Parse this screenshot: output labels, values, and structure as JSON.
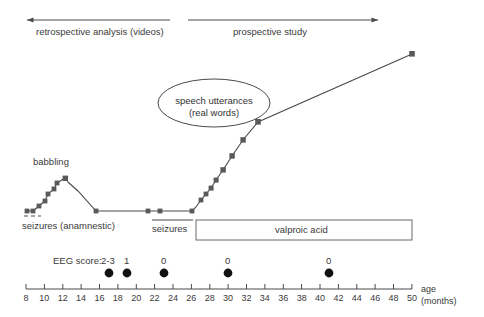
{
  "figure": {
    "title_phases": {
      "retrospective": "retrospective analysis (videos)",
      "prospective": "prospective study"
    },
    "annotations": {
      "babbling": "babbling",
      "speech_line1": "speech utterances",
      "speech_line2": "(real words)",
      "seizures_anamnestic": "seizures (anamnestic)",
      "seizures": "seizures",
      "valproic_acid": "valproic acid",
      "eeg_score_label": "EEG score:"
    },
    "axis": {
      "label_line1": "age",
      "label_line2": "(months)",
      "ticks": [
        "8",
        "10",
        "12",
        "14",
        "16",
        "18",
        "20",
        "22",
        "24",
        "26",
        "28",
        "30",
        "32",
        "34",
        "36",
        "38",
        "40",
        "42",
        "44",
        "46",
        "48",
        "50"
      ],
      "min": 8,
      "max": 50,
      "step": 2
    },
    "eeg_scores": [
      {
        "label": "2-3",
        "age": 26
      },
      {
        "label": "1",
        "age": 28
      },
      {
        "label": "0",
        "age": 32
      },
      {
        "label": "0",
        "age": 39
      },
      {
        "label": "0",
        "age": 50
      }
    ],
    "colors": {
      "line": "#4a4a4a",
      "marker": "#595959",
      "text": "#3a3a3a",
      "eeg_dot": "#111111",
      "box_border": "#6b6b6b"
    }
  },
  "chart_data": {
    "type": "line",
    "title": "",
    "xlabel": "age (months)",
    "ylabel": "language development (speech utterances / real words)",
    "xlim": [
      8,
      50
    ],
    "grid": false,
    "legend": "none",
    "series": [
      {
        "name": "language development",
        "x": [
          8.3,
          9.6,
          11.0,
          11.9,
          12.6,
          14.2,
          16.5,
          22.0,
          23.2,
          26.0,
          26.9,
          27.6,
          28.4,
          29.2,
          30.2,
          31.6,
          33.6,
          35.9,
          39.0,
          50.0
        ],
        "y": [
          2,
          2,
          5,
          8,
          12,
          2,
          2,
          2,
          2,
          2,
          9,
          14,
          20,
          25,
          33,
          44,
          57,
          70,
          84,
          124
        ]
      }
    ],
    "annotations": [
      {
        "text": "babbling",
        "x": 13.5,
        "y": 55
      },
      {
        "text": "speech utterances (real words)",
        "x": 27.5,
        "y": 95
      },
      {
        "text": "seizures (anamnestic)",
        "x": 12.0,
        "y": -12
      },
      {
        "text": "seizures",
        "x": 25.5,
        "y": -12
      },
      {
        "text": "valproic acid",
        "x": 38.5,
        "y": -16
      }
    ],
    "spans": [
      {
        "name": "retrospective analysis (videos)",
        "x0": 8.0,
        "x1": 30.0
      },
      {
        "name": "prospective study",
        "x0": 31.5,
        "x1": 50.5
      },
      {
        "name": "seizures (anamnestic)",
        "x0": 8.0,
        "x1": 10.0,
        "style": "dashed"
      },
      {
        "name": "seizures",
        "x0": 24.5,
        "x1": 29.5,
        "style": "solid"
      },
      {
        "name": "valproic acid",
        "x0": 26.5,
        "x1": 50.0,
        "style": "box"
      }
    ]
  }
}
